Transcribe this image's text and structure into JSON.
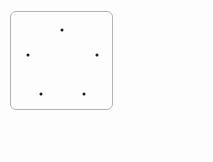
{
  "canvas": {
    "width": 213,
    "height": 162,
    "background": "#fdfdfd"
  },
  "figure": {
    "name": "dot-region",
    "shape": "rounded-square",
    "border_color": "#b3b3b3",
    "fill_color": "#fdfdfd",
    "x": 10,
    "y": 11,
    "width": 103,
    "height": 99,
    "corner_radius": 6,
    "dot_color": "#1a1a1a",
    "dot_size": 3,
    "dot_count": 5,
    "dots": [
      {
        "label": "dot-top",
        "x": 61,
        "y": 29
      },
      {
        "label": "dot-middle-left",
        "x": 27,
        "y": 54
      },
      {
        "label": "dot-middle-right",
        "x": 96,
        "y": 54
      },
      {
        "label": "dot-bottom-left",
        "x": 40,
        "y": 93
      },
      {
        "label": "dot-bottom-right",
        "x": 83,
        "y": 93
      }
    ]
  },
  "answer": {
    "open_paren": "(",
    "close_paren_with_unit": ")개",
    "unit": "개",
    "value": ""
  }
}
